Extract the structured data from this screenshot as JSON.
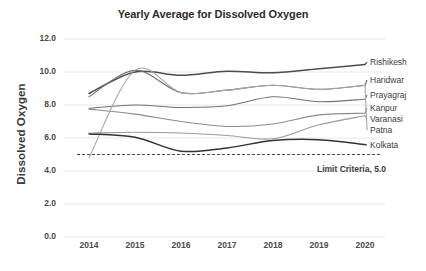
{
  "chart_data": {
    "type": "line",
    "title": "Yearly Average for Dissolved Oxygen",
    "xlabel": "",
    "ylabel": "Dissolved Oxygen",
    "x": [
      2014,
      2015,
      2016,
      2017,
      2018,
      2019,
      2020
    ],
    "xticklabels": [
      "2014",
      "2015",
      "2016",
      "2017",
      "2018",
      "2019",
      "2020"
    ],
    "yticklabels": [
      "0.0",
      "2.0",
      "4.0",
      "6.0",
      "8.0",
      "10.0",
      "12.0"
    ],
    "yticks": [
      0.0,
      2.0,
      4.0,
      6.0,
      8.0,
      10.0,
      12.0
    ],
    "ylim": [
      0.0,
      12.0
    ],
    "grid": true,
    "legend_position": "right-inline-labels",
    "smoothing": "spline",
    "series": [
      {
        "name": "Rishikesh",
        "color": "#4d4d4d",
        "width": 1.5,
        "values": [
          8.7,
          10.0,
          9.8,
          10.05,
          9.95,
          10.2,
          10.45
        ]
      },
      {
        "name": "Haridwar",
        "color": "#6e6e6e",
        "width": 1.1,
        "values": [
          8.5,
          10.1,
          8.75,
          8.9,
          9.2,
          8.95,
          9.2
        ]
      },
      {
        "name": "Prayagraj",
        "color": "#737373",
        "width": 1.1,
        "values": [
          7.8,
          8.0,
          7.85,
          7.95,
          8.5,
          8.2,
          8.35
        ]
      },
      {
        "name": "Kanpur",
        "color": "#8c8c8c",
        "width": 1.1,
        "values": [
          7.75,
          7.45,
          7.0,
          6.7,
          6.85,
          7.4,
          7.5
        ]
      },
      {
        "name": "Varanasi",
        "color": "#9a9a9a",
        "width": 1.1,
        "values": [
          6.3,
          6.35,
          6.3,
          6.15,
          5.95,
          6.8,
          7.35
        ]
      },
      {
        "name": "Patna",
        "color": "#a6a6a6",
        "width": 1.1,
        "values": [
          4.8,
          10.1,
          8.75,
          8.9,
          9.2,
          8.95,
          9.2
        ]
      },
      {
        "name": "Kolkata",
        "color": "#333333",
        "width": 1.5,
        "values": [
          6.25,
          6.05,
          5.2,
          5.4,
          5.85,
          5.9,
          5.6
        ]
      }
    ],
    "reference_line": {
      "label": "Limit Criteria, 5.0",
      "value": 5.0,
      "style": "dashed",
      "color": "#4a4a4a"
    }
  },
  "labels": {
    "series_labels": [
      "Rishikesh",
      "Haridwar",
      "Prayagraj",
      "Kanpur",
      "Varanasi",
      "Patna",
      "Kolkata"
    ],
    "limit_text": "Limit Criteria, 5.0"
  }
}
